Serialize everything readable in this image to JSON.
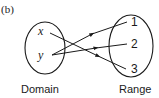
{
  "figure": {
    "panel_label": "(b)",
    "domain": {
      "label": "Domain",
      "elements": [
        "x",
        "y"
      ]
    },
    "range": {
      "label": "Range",
      "elements": [
        "1",
        "2",
        "3"
      ]
    },
    "mappings": [
      {
        "from": "x",
        "to": "3"
      },
      {
        "from": "y",
        "to": "1"
      },
      {
        "from": "y",
        "to": "2"
      }
    ],
    "stroke_color": "#1a1a1a"
  }
}
